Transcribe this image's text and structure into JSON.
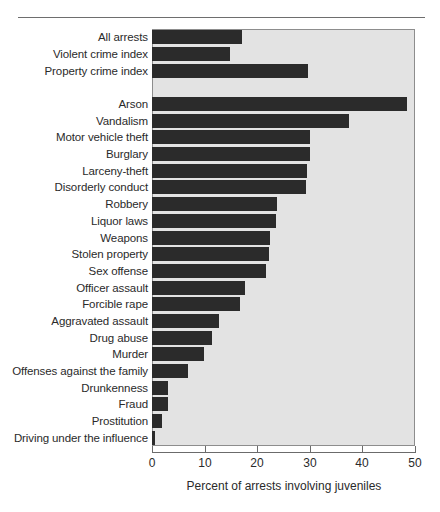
{
  "chart_data": {
    "type": "bar",
    "orientation": "horizontal",
    "title": "",
    "xlabel": "Percent of arrests involving juveniles",
    "ylabel": "",
    "xlim": [
      0,
      50
    ],
    "xticks": [
      0,
      10,
      20,
      30,
      40,
      50
    ],
    "grid": false,
    "legend": null,
    "plot_background": "#e3e3e3",
    "bar_color": "#2b2b2b",
    "groups": [
      {
        "name": "summary-indexes",
        "categories": [
          "All arrests",
          "Violent crime index",
          "Property crime index"
        ],
        "values": [
          17.1,
          14.8,
          29.7
        ]
      },
      {
        "name": "offense-types",
        "categories": [
          "Arson",
          "Vandalism",
          "Motor vehicle theft",
          "Burglary",
          "Larceny-theft",
          "Disorderly conduct",
          "Robbery",
          "Liquor laws",
          "Weapons",
          "Stolen property",
          "Sex offense",
          "Officer assault",
          "Forcible rape",
          "Aggravated assault",
          "Drug abuse",
          "Murder",
          "Offenses against the family",
          "Drunkenness",
          "Fraud",
          "Prostitution",
          "Driving under the influence"
        ],
        "values": [
          48.5,
          37.5,
          30.0,
          30.0,
          29.4,
          29.2,
          23.8,
          23.6,
          22.4,
          22.3,
          21.7,
          17.7,
          16.7,
          12.7,
          11.4,
          9.9,
          6.8,
          3.0,
          3.1,
          1.9,
          0.6
        ]
      }
    ],
    "categories": [
      "All arrests",
      "Violent crime index",
      "Property crime index",
      "Arson",
      "Vandalism",
      "Motor vehicle theft",
      "Burglary",
      "Larceny-theft",
      "Disorderly conduct",
      "Robbery",
      "Liquor laws",
      "Weapons",
      "Stolen property",
      "Sex offense",
      "Officer assault",
      "Forcible rape",
      "Aggravated assault",
      "Drug abuse",
      "Murder",
      "Offenses against the family",
      "Drunkenness",
      "Fraud",
      "Prostitution",
      "Driving under the influence"
    ],
    "values": [
      17.1,
      14.8,
      29.7,
      48.5,
      37.5,
      30.0,
      30.0,
      29.4,
      29.2,
      23.8,
      23.6,
      22.4,
      22.3,
      21.7,
      17.7,
      16.7,
      12.7,
      11.4,
      9.9,
      6.8,
      3.0,
      3.1,
      1.9,
      0.6
    ]
  }
}
